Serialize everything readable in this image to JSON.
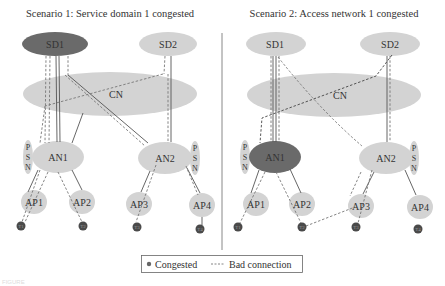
{
  "colors": {
    "normal_node": "#d3d3d3",
    "congested_node": "#6a6a6a",
    "terminal": "#4a4a4a",
    "line": "#555555",
    "bad_line": "#777777",
    "divider": "#888888"
  },
  "scenarios": [
    {
      "title": "Scenario 1: Service domain 1 congested",
      "congested": "SD1",
      "nodes": {
        "sd1": "SD1",
        "sd2": "SD2",
        "cn": "CN",
        "an1": "AN1",
        "an2": "AN2",
        "ap1": "AP1",
        "ap2": "AP2",
        "ap3": "AP3",
        "ap4": "AP4",
        "t1": "T1",
        "t2": "T2",
        "t3": "T3",
        "t4": "T4",
        "psn1": [
          "P",
          "S",
          "N"
        ],
        "psn2": [
          "P",
          "S",
          "N"
        ]
      }
    },
    {
      "title": "Scenario 2: Access network 1 congested",
      "congested": "AN1",
      "nodes": {
        "sd1": "SD1",
        "sd2": "SD2",
        "cn": "CN",
        "an1": "AN1",
        "an2": "AN2",
        "ap1": "AP1",
        "ap2": "AP2",
        "ap3": "AP3",
        "ap4": "AP4",
        "t1": "T1",
        "t2": "T2",
        "t3": "T3",
        "t4": "T4",
        "psn1": [
          "P",
          "S",
          "N"
        ],
        "psn2": [
          "P",
          "S",
          "N"
        ]
      }
    }
  ],
  "legend": {
    "congested_label": "Congested",
    "bad_connection_label": "Bad connection",
    "bad_connection_symbol": "----"
  },
  "caption": "FIGURE"
}
